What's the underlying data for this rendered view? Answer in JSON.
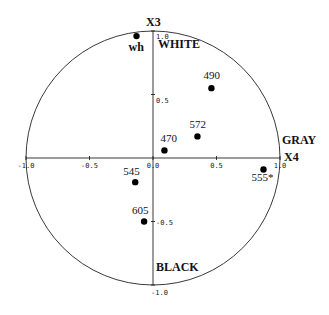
{
  "chart_data": {
    "type": "scatter",
    "title": "",
    "xlabel": "X4",
    "ylabel": "X3",
    "xlim": [
      -1.0,
      1.0
    ],
    "ylim": [
      -1.0,
      1.0
    ],
    "grid": false,
    "unit_circle": true,
    "x_ticks": [
      "-1.0",
      "-0.5",
      "0.0",
      "0.5",
      "1.0"
    ],
    "x_tick_values": [
      -1.0,
      -0.5,
      0.0,
      0.5,
      1.0
    ],
    "y_ticks": [
      "1.0",
      "0.5",
      "-0.5",
      "-1.0"
    ],
    "y_tick_values": [
      1.0,
      0.5,
      -0.5,
      -1.0
    ],
    "annotations": [
      {
        "text": "WHITE",
        "near": "top"
      },
      {
        "text": "GRAY",
        "near": "right"
      },
      {
        "text": "BLACK",
        "near": "bottom"
      }
    ],
    "points": [
      {
        "label": "wh",
        "x": -0.13,
        "y": 0.96
      },
      {
        "label": "490",
        "x": 0.46,
        "y": 0.55
      },
      {
        "label": "572",
        "x": 0.35,
        "y": 0.17
      },
      {
        "label": "470",
        "x": 0.09,
        "y": 0.06
      },
      {
        "label": "545",
        "x": -0.14,
        "y": -0.19
      },
      {
        "label": "605",
        "x": -0.07,
        "y": -0.5
      },
      {
        "label": "555*",
        "x": 0.87,
        "y": -0.09
      }
    ]
  }
}
